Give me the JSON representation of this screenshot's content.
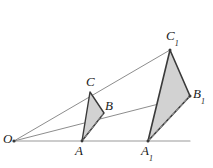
{
  "figure": {
    "background_color": "#ffffff",
    "stroke_color": "#3a3a3a",
    "fill_color": "#d2d2d2",
    "ray_color": "#8a8a8a",
    "dashed_color": "#9a9a9a",
    "width": 213,
    "height": 168
  },
  "points": {
    "O": {
      "label": "O",
      "sub": "",
      "x": 14,
      "y": 141,
      "label_x": 3,
      "label_y": 133
    },
    "A": {
      "label": "A",
      "sub": "",
      "x": 82,
      "y": 141,
      "label_x": 75,
      "label_y": 145
    },
    "B": {
      "label": "B",
      "sub": "",
      "x": 104,
      "y": 113,
      "label_x": 104,
      "label_y": 100
    },
    "C": {
      "label": "C",
      "sub": "",
      "x": 90,
      "y": 92,
      "label_x": 86,
      "label_y": 76
    },
    "A1": {
      "label": "A",
      "sub": "1",
      "x": 148,
      "y": 141,
      "label_x": 141,
      "label_y": 145
    },
    "B1": {
      "label": "B",
      "sub": "1",
      "x": 190,
      "y": 96,
      "label_x": 192,
      "label_y": 88
    },
    "C1": {
      "label": "C",
      "sub": "1",
      "x": 170,
      "y": 50,
      "label_x": 166,
      "label_y": 30
    }
  },
  "shapes": {
    "small_triangle": {
      "name": "triangle-ABC",
      "vertices": "82,141 90,92 104,113",
      "closed": true
    },
    "large_triangle": {
      "name": "triangle-A1B1C1",
      "vertices": "148,141 170,50 190,96",
      "closed": true
    },
    "hidden_edge_small": {
      "from_x": 82,
      "from_y": 141,
      "to_x": 104,
      "to_y": 113
    },
    "hidden_edge_large": {
      "from_x": 148,
      "from_y": 141,
      "to_x": 190,
      "to_y": 96
    }
  },
  "rays": [
    {
      "name": "ray-O-A-A1",
      "x1": 14,
      "y1": 141,
      "x2": 190,
      "y2": 141
    },
    {
      "name": "ray-O-B-B1",
      "x1": 14,
      "y1": 141,
      "x2": 190,
      "y2": 96
    },
    {
      "name": "ray-O-C-C1",
      "x1": 14,
      "y1": 141,
      "x2": 170,
      "y2": 50
    }
  ]
}
